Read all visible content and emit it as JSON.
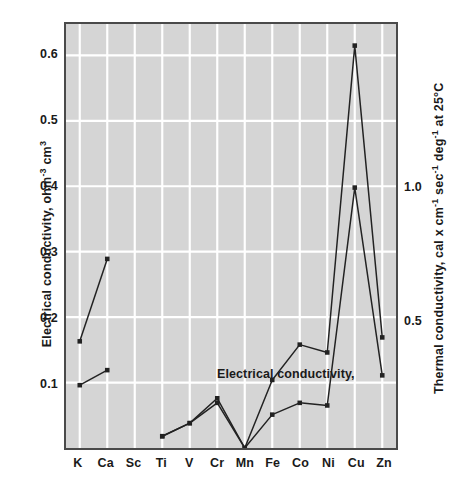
{
  "chart_data": {
    "type": "line",
    "title": "",
    "xlabel": "",
    "ylabel": "Electrical conductivity, ohm-3 cm3",
    "y2label": "Thermal conductivity, cal x cm-1 sec-1 deg-1 at 25 C",
    "categories": [
      "K",
      "Ca",
      "Sc",
      "Ti",
      "V",
      "Cr",
      "Mn",
      "Fe",
      "Co",
      "Ni",
      "Cu",
      "Zn"
    ],
    "ylim": [
      0.0,
      0.648
    ],
    "yticks": [
      0.1,
      0.2,
      0.3,
      0.4,
      0.5,
      0.6
    ],
    "ytick_labels": [
      "0.1",
      "0.2",
      "0.3",
      "0.4",
      "0.5",
      "0.6"
    ],
    "y2lim": [
      0.0,
      1.63
    ],
    "y2ticks": [
      0.5,
      1.0
    ],
    "y2tick_labels": [
      "0.5",
      "1.0"
    ],
    "y2_left_positions": [
      0.196,
      0.398
    ],
    "grid": true,
    "grid_color": "#ffffff",
    "plot_background": "#d5d5d5",
    "line_color": "#222222",
    "marker": "square",
    "legend_position": "inline-annotation",
    "series": [
      {
        "name": "Electrical conductivity,",
        "label_x": "Cr",
        "values": [
          0.163,
          0.289,
          null,
          0.018,
          0.038,
          0.076,
          0.0,
          0.104,
          0.158,
          0.146,
          0.615,
          0.169
        ]
      },
      {
        "name": "Thermal conductivity",
        "label_x": "Fe",
        "values": [
          0.096,
          0.119,
          null,
          0.018,
          0.038,
          0.069,
          0.0,
          0.051,
          0.069,
          0.065,
          0.398,
          0.111
        ]
      }
    ],
    "annotations": [
      {
        "text": "Electrical conductivity,",
        "x_px": 151,
        "y_px": 343
      },
      {
        "text": "Thermal conductivity",
        "x_px": 281,
        "y_px": 423
      }
    ]
  },
  "axes": {
    "left": {
      "title_prefix": "Electrical conductivity, ohm",
      "title_sup1": "-3",
      "title_mid": " cm",
      "title_sup2": "3",
      "ticks": [
        "0.1",
        "0.2",
        "0.3",
        "0.4",
        "0.5",
        "0.6"
      ]
    },
    "right": {
      "title_prefix": "Thermal conductivity,  cal x cm",
      "title_sup1": "-1",
      "title_mid1": " sec",
      "title_sup2": "-1",
      "title_mid2": " deg",
      "title_sup3": "-1",
      "title_suffix": " at 25°C",
      "ticks": [
        "0.5",
        "1.0"
      ]
    },
    "bottom": {
      "ticks": [
        "K",
        "Ca",
        "Sc",
        "Ti",
        "V",
        "Cr",
        "Mn",
        "Fe",
        "Co",
        "Ni",
        "Cu",
        "Zn"
      ]
    }
  }
}
